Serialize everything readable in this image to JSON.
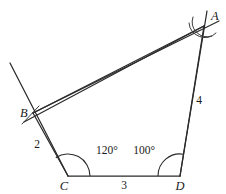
{
  "figure": {
    "type": "geometry-diagram",
    "shape": "quadrilateral",
    "stroke_color": "#2b2b2b",
    "background_color": "#ffffff"
  },
  "vertices": {
    "A": {
      "label": "A",
      "x": 204,
      "y": 26
    },
    "B": {
      "label": "B",
      "x": 33,
      "y": 113
    },
    "C": {
      "label": "C",
      "x": 68,
      "y": 176
    },
    "D": {
      "label": "D",
      "x": 180,
      "y": 176
    }
  },
  "sides": [
    {
      "name": "BC",
      "label": "2",
      "from": "B",
      "to": "C"
    },
    {
      "name": "CD",
      "label": "3",
      "from": "C",
      "to": "D"
    },
    {
      "name": "AD",
      "label": "4",
      "from": "D",
      "to": "A"
    },
    {
      "name": "BA",
      "label": "",
      "from": "B",
      "to": "A"
    }
  ],
  "angles": [
    {
      "name": "angle-C",
      "at": "C",
      "label": "120°"
    },
    {
      "name": "angle-D",
      "at": "D",
      "label": "100°"
    }
  ],
  "construction_marks": {
    "at_A": "crossing-arcs",
    "at_B": "tick-mark",
    "extended_lines": [
      "BA-beyond-A",
      "DA-beyond-A",
      "CB-beyond-B",
      "AB-beyond-B"
    ]
  }
}
